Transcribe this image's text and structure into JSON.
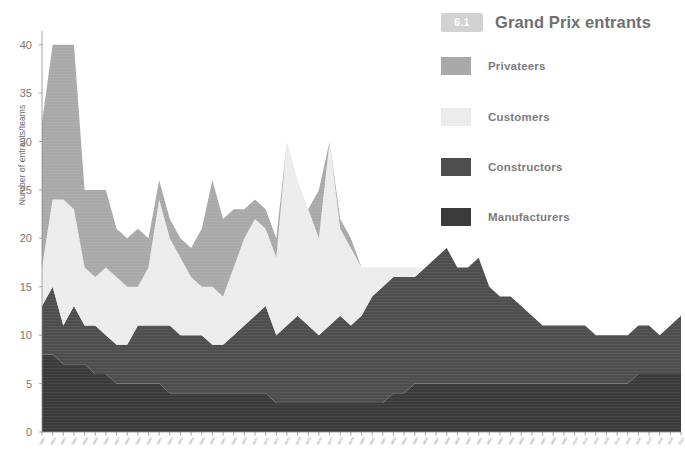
{
  "legend": {
    "badge": "6.1",
    "title": "Grand Prix entrants",
    "items": [
      {
        "label": "Privateers",
        "color": "#a9a9a9"
      },
      {
        "label": "Customers",
        "color": "#ececec"
      },
      {
        "label": "Constructors",
        "color": "#4e4e4e"
      },
      {
        "label": "Manufacturers",
        "color": "#3b3b3b"
      }
    ]
  },
  "axes": {
    "ylabel": "Number of entrants/teams",
    "xlabel": "",
    "yticks": [
      0,
      5,
      10,
      15,
      20,
      25,
      30,
      35,
      40
    ],
    "ylim": [
      0,
      41
    ],
    "grid": false
  },
  "chart_data": {
    "type": "area",
    "stacked": true,
    "title": "Grand Prix entrants",
    "xlabel": "",
    "ylabel": "Number of entrants/teams",
    "ylim": [
      0,
      41
    ],
    "legend_position": "right",
    "grid": false,
    "categories": [
      "1950",
      "1951",
      "1952",
      "1953",
      "1954",
      "1955",
      "1956",
      "1957",
      "1958",
      "1959",
      "1960",
      "1961",
      "1962",
      "1963",
      "1964",
      "1965",
      "1966",
      "1967",
      "1968",
      "1969",
      "1970",
      "1971",
      "1972",
      "1973",
      "1974",
      "1975",
      "1976",
      "1977",
      "1978",
      "1979",
      "1980",
      "1981",
      "1982",
      "1983",
      "1984",
      "1985",
      "1986",
      "1987",
      "1988",
      "1989",
      "1990",
      "1991",
      "1992",
      "1993",
      "1994",
      "1995",
      "1996",
      "1997",
      "1998",
      "1999",
      "2000",
      "2001",
      "2002",
      "2003",
      "2004",
      "2005",
      "2006",
      "2007",
      "2008",
      "2009",
      "2010"
    ],
    "series": [
      {
        "name": "Manufacturers",
        "color": "#3b3b3b",
        "values": [
          8,
          8,
          7,
          7,
          7,
          6,
          6,
          5,
          5,
          5,
          5,
          5,
          4,
          4,
          4,
          4,
          4,
          4,
          4,
          4,
          4,
          4,
          3,
          3,
          3,
          3,
          3,
          3,
          3,
          3,
          3,
          3,
          3,
          4,
          4,
          5,
          5,
          5,
          5,
          5,
          5,
          5,
          5,
          5,
          5,
          5,
          5,
          5,
          5,
          5,
          5,
          5,
          5,
          5,
          5,
          5,
          6,
          6,
          6,
          6,
          6
        ]
      },
      {
        "name": "Constructors",
        "color": "#4e4e4e",
        "values": [
          5,
          7,
          4,
          6,
          4,
          5,
          4,
          4,
          4,
          6,
          6,
          6,
          7,
          6,
          6,
          6,
          5,
          5,
          6,
          7,
          8,
          9,
          7,
          8,
          9,
          8,
          7,
          8,
          9,
          8,
          9,
          11,
          12,
          12,
          12,
          11,
          12,
          13,
          14,
          12,
          12,
          13,
          10,
          9,
          9,
          8,
          7,
          6,
          6,
          6,
          6,
          6,
          5,
          5,
          5,
          5,
          5,
          5,
          4,
          5,
          6
        ]
      },
      {
        "name": "Customers",
        "color": "#ececec",
        "values": [
          4,
          9,
          13,
          10,
          6,
          5,
          7,
          7,
          6,
          4,
          6,
          13,
          9,
          8,
          6,
          5,
          6,
          5,
          7,
          9,
          10,
          8,
          8,
          19,
          14,
          12,
          10,
          19,
          9,
          8,
          5,
          3,
          2,
          1,
          1,
          1,
          0,
          0,
          0,
          0,
          0,
          0,
          0,
          0,
          0,
          0,
          0,
          0,
          0,
          0,
          0,
          0,
          0,
          0,
          0,
          0,
          0,
          0,
          0,
          0,
          0
        ]
      },
      {
        "name": "Privateers",
        "color": "#a9a9a9",
        "values": [
          15,
          16,
          16,
          17,
          8,
          9,
          8,
          5,
          5,
          6,
          3,
          2,
          2,
          2,
          3,
          6,
          11,
          8,
          6,
          3,
          2,
          2,
          2,
          0,
          0,
          0,
          5,
          0,
          1,
          1,
          0,
          0,
          0,
          0,
          0,
          0,
          0,
          0,
          0,
          0,
          0,
          0,
          0,
          0,
          0,
          0,
          0,
          0,
          0,
          0,
          0,
          0,
          0,
          0,
          0,
          0,
          0,
          0,
          0,
          0,
          0
        ]
      }
    ],
    "stack_order": [
      "Manufacturers",
      "Constructors",
      "Customers",
      "Privateers"
    ],
    "totals": [
      32,
      40,
      40,
      40,
      25,
      25,
      25,
      21,
      20,
      21,
      20,
      26,
      22,
      20,
      19,
      21,
      26,
      22,
      23,
      23,
      24,
      23,
      20,
      30,
      26,
      23,
      25,
      30,
      22,
      20,
      17,
      17,
      17,
      17,
      17,
      17,
      17,
      18,
      19,
      17,
      17,
      18,
      15,
      14,
      14,
      13,
      12,
      11,
      11,
      11,
      11,
      11,
      10,
      10,
      10,
      10,
      11,
      11,
      10,
      11,
      12
    ]
  }
}
